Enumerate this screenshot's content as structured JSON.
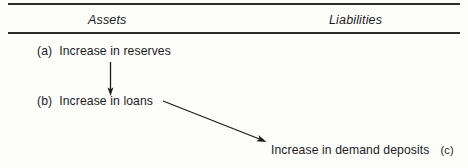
{
  "figure": {
    "type": "t-account-flow-diagram",
    "columns": {
      "assets_label": "Assets",
      "liabilities_label": "Liabilities"
    },
    "entries": [
      {
        "tag": "(a)",
        "text": "Increase in reserves",
        "side": "assets",
        "tag_position": "leading"
      },
      {
        "tag": "(b)",
        "text": "Increase in loans",
        "side": "assets",
        "tag_position": "leading"
      },
      {
        "tag": "(c)",
        "text": "Increase in demand deposits",
        "side": "liabilities",
        "tag_position": "trailing"
      }
    ],
    "arrows": [
      {
        "name": "arrow-a-to-b",
        "from": "(a) Increase in reserves",
        "to": "(b) Increase in loans",
        "orientation": "vertical-down"
      },
      {
        "name": "arrow-b-to-c",
        "from": "(b) Increase in loans",
        "to": "Increase in demand deposits (c)",
        "orientation": "diagonal-down-right"
      }
    ],
    "colors": {
      "ink": "#1c1c1c",
      "rule": "#2b2b2b",
      "background": "#fdfdfc"
    }
  }
}
